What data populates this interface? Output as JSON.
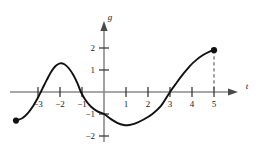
{
  "chart_data": {
    "type": "line",
    "title": "",
    "xlabel": "t",
    "ylabel": "g",
    "xlim": [
      -4.4,
      6.2
    ],
    "ylim": [
      -2.6,
      2.9
    ],
    "grid": false,
    "legend": null,
    "xticks": [
      -3,
      -2,
      -1,
      1,
      2,
      3,
      4,
      5
    ],
    "xtick_labels": [
      "−3",
      "−2",
      "−1",
      "1",
      "2",
      "3",
      "4",
      "5"
    ],
    "yticks": [
      -2,
      -1,
      1,
      2
    ],
    "ytick_labels": [
      "−2",
      "−1",
      "1",
      "2"
    ],
    "series": [
      {
        "name": "g",
        "points": [
          [
            -4.0,
            -1.3
          ],
          [
            -3.7,
            -1.18
          ],
          [
            -3.45,
            -0.95
          ],
          [
            -3.2,
            -0.6
          ],
          [
            -3.0,
            -0.25
          ],
          [
            -2.8,
            0.15
          ],
          [
            -2.6,
            0.55
          ],
          [
            -2.4,
            0.92
          ],
          [
            -2.2,
            1.18
          ],
          [
            -2.0,
            1.3
          ],
          [
            -1.8,
            1.26
          ],
          [
            -1.6,
            1.08
          ],
          [
            -1.4,
            0.78
          ],
          [
            -1.2,
            0.38
          ],
          [
            -1.05,
            0.0
          ],
          [
            -0.85,
            -0.35
          ],
          [
            -0.6,
            -0.66
          ],
          [
            -0.3,
            -0.88
          ],
          [
            0.0,
            -1.0
          ],
          [
            0.3,
            -1.22
          ],
          [
            0.6,
            -1.4
          ],
          [
            0.9,
            -1.5
          ],
          [
            1.15,
            -1.5
          ],
          [
            1.4,
            -1.44
          ],
          [
            1.8,
            -1.25
          ],
          [
            2.2,
            -1.0
          ],
          [
            2.6,
            -0.62
          ],
          [
            3.0,
            0.0
          ],
          [
            3.3,
            0.42
          ],
          [
            3.6,
            0.82
          ],
          [
            3.9,
            1.18
          ],
          [
            4.2,
            1.46
          ],
          [
            4.5,
            1.68
          ],
          [
            4.8,
            1.84
          ],
          [
            5.0,
            1.9
          ]
        ]
      }
    ],
    "endpoints": [
      {
        "name": "left-endpoint",
        "x": -4.0,
        "y": -1.3,
        "style": "filled"
      },
      {
        "name": "right-endpoint",
        "x": 5.0,
        "y": 1.9,
        "style": "filled"
      }
    ],
    "annotations": [
      {
        "name": "dashed-drop-line",
        "type": "dashed-vertical",
        "x": 5.0,
        "y_from": 1.9,
        "y_to": 0.0
      }
    ],
    "zero_crossings": [
      -2.87,
      -1.05,
      3.0
    ],
    "local_max": {
      "x": -2.0,
      "y": 1.3
    },
    "local_min": {
      "x": 1.0,
      "y": -1.5
    },
    "y_intercept": -1.0
  },
  "colors": {
    "curve": "#111111",
    "axis": "#8a8a8a",
    "tick": "#3a3a3a",
    "text": "#1a1a1a",
    "dash": "#555555",
    "background": "#ffffff"
  }
}
